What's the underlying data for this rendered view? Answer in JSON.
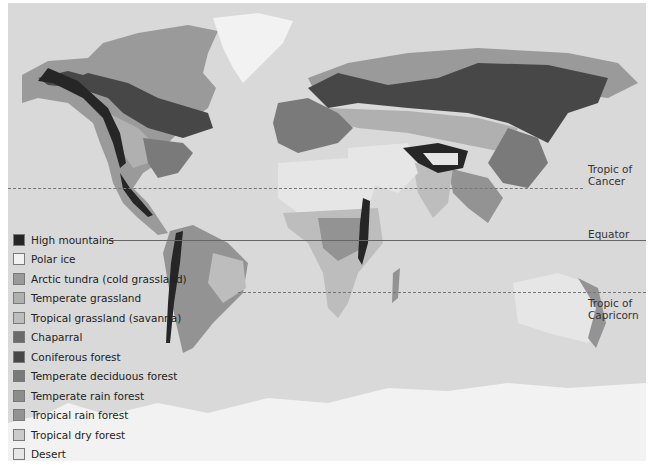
{
  "map": {
    "title": "World biomes",
    "background_color": "#d9d9d9"
  },
  "legend": {
    "items": [
      {
        "label": "High mountains",
        "color": "#262626"
      },
      {
        "label": "Polar ice",
        "color": "#f2f2f2"
      },
      {
        "label": "Arctic tundra (cold grassland)",
        "color": "#9a9a9a"
      },
      {
        "label": "Temperate grassland",
        "color": "#b0b0b0"
      },
      {
        "label": "Tropical grassland (savanna)",
        "color": "#bdbdbd"
      },
      {
        "label": "Chaparral",
        "color": "#6a6a6a"
      },
      {
        "label": "Coniferous forest",
        "color": "#474747"
      },
      {
        "label": "Temperate deciduous forest",
        "color": "#7a7a7a"
      },
      {
        "label": "Temperate rain forest",
        "color": "#8c8c8c"
      },
      {
        "label": "Tropical rain forest",
        "color": "#939393"
      },
      {
        "label": "Tropical dry forest",
        "color": "#cbcbcb"
      },
      {
        "label": "Desert",
        "color": "#e6e6e6"
      }
    ]
  },
  "latitude_lines": {
    "tropic_of_cancer": {
      "line1": "Tropic of",
      "line2": "Cancer"
    },
    "equator": {
      "label": "Equator"
    },
    "tropic_of_capricorn": {
      "line1": "Tropic of",
      "line2": "Capricorn"
    }
  }
}
